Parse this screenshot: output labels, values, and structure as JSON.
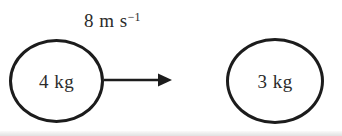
{
  "diagram": {
    "left_ball": {
      "mass_label": "4 kg"
    },
    "right_ball": {
      "mass_label": "3 kg"
    },
    "velocity": {
      "label_base": "8 m s",
      "label_exponent": "−1",
      "direction": "right"
    },
    "colors": {
      "stroke": "#1c1c1c",
      "text": "#2b2b2b",
      "background": "#ffffff"
    }
  }
}
